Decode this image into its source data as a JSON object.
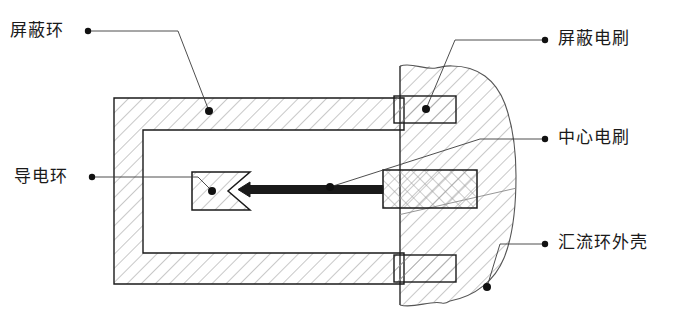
{
  "figure": {
    "background_color": "#ffffff",
    "line_color": "#1a1a1a",
    "hatch_color": "#8a8a8a",
    "width": 678,
    "height": 321
  },
  "labels": {
    "shield_ring": {
      "text": "屏蔽环",
      "x": 10,
      "y": 22,
      "dot_x": 86,
      "dot_y": 31,
      "target_x": 209,
      "target_y": 111
    },
    "shield_brush": {
      "text": "屏蔽电刷",
      "x": 558,
      "y": 30,
      "dot_x": 547,
      "dot_y": 40,
      "target_x": 426,
      "target_y": 109
    },
    "center_brush": {
      "text": "中心电刷",
      "x": 558,
      "y": 129,
      "dot_x": 547,
      "dot_y": 139,
      "target_x": 330,
      "target_y": 187
    },
    "conductive_ring": {
      "text": "导电环",
      "x": 14,
      "y": 168,
      "dot_x": 90,
      "dot_y": 177,
      "target_x": 212,
      "target_y": 191
    },
    "slip_ring_housing": {
      "text": "汇流环外壳",
      "x": 558,
      "y": 234,
      "dot_x": 547,
      "dot_y": 244,
      "target_x": 487,
      "target_y": 287
    }
  },
  "parts": {
    "shield_ring": {
      "name": "屏蔽环",
      "hatch": "diagonal-45",
      "outer": {
        "x": 114,
        "y": 98,
        "w": 290,
        "h": 186
      },
      "inner": {
        "x": 143,
        "y": 130,
        "w": 261,
        "h": 123
      }
    },
    "housing": {
      "name": "汇流环外壳",
      "hatch": "diagonal-45",
      "left_edge_x": 400,
      "top_y": 66,
      "bottom_y": 305,
      "right_x": 520
    },
    "shield_brush_top": {
      "name": "屏蔽电刷(上)",
      "hatch": "diagonal-45",
      "x": 394,
      "y": 96,
      "w": 62,
      "h": 27
    },
    "shield_brush_bottom": {
      "name": "屏蔽电刷(下)",
      "hatch": "diagonal-45",
      "x": 394,
      "y": 255,
      "w": 62,
      "h": 27
    },
    "center_brush": {
      "name": "中心电刷",
      "hatch": "cross-45",
      "x": 383,
      "y": 170,
      "w": 94,
      "h": 38
    },
    "brush_arm": {
      "name": "中心电刷臂",
      "x1": 383,
      "y1": 189,
      "x2": 240,
      "y2": 189,
      "thickness": 7
    },
    "conductive_ring": {
      "name": "导电环",
      "hatch": "diagonal-45",
      "x": 192,
      "y": 172,
      "w": 58,
      "h": 38,
      "notch_depth": 22
    }
  }
}
